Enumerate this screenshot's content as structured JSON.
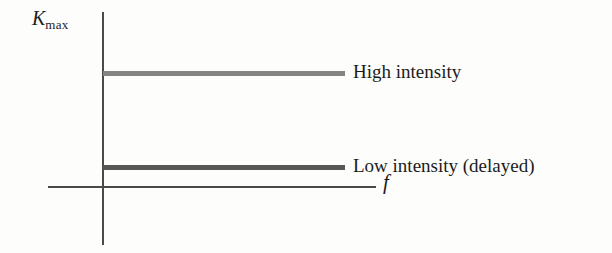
{
  "chart_data": {
    "type": "line",
    "title": "",
    "xlabel": "f",
    "ylabel": "K_max",
    "grid": false,
    "legend_position": "inline-right",
    "axes": {
      "y_label_main": "K",
      "y_label_sub": "max",
      "x_label": "f"
    },
    "series": [
      {
        "name": "High intensity",
        "style": "horizontal-line",
        "color": "#858585",
        "y_value_relative": 0.62,
        "x_start_relative": 0.0,
        "x_end_relative": 1.0
      },
      {
        "name": "Low intensity (delayed)",
        "style": "horizontal-line",
        "color": "#575757",
        "y_value_relative": 0.11,
        "x_start_relative": 0.0,
        "x_end_relative": 1.0
      }
    ],
    "annotations": [
      "High intensity",
      "Low intensity (delayed)"
    ]
  },
  "figure": {
    "y_axis_label_main": "K",
    "y_axis_label_sub": "max",
    "x_axis_label": "f",
    "series_labels": {
      "high": "High intensity",
      "low": "Low intensity (delayed)"
    },
    "colors": {
      "background": "#fdfdfb",
      "axis": "#4a4a4a",
      "high_intensity_line": "#858585",
      "low_intensity_line": "#575757",
      "text": "#1c1c1c"
    }
  }
}
